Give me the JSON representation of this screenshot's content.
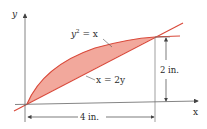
{
  "diagram": {
    "axes": {
      "x_label": "x",
      "y_label": "y"
    },
    "curves": [
      {
        "name": "parabola",
        "equation_base": "y",
        "equation_exp": "2",
        "equation_rest": " = x"
      },
      {
        "name": "line",
        "equation": "x = 2y"
      }
    ],
    "dimensions": {
      "width": "4 in.",
      "height": "2 in."
    },
    "colors": {
      "fill": "#f2a89c",
      "curve": "#d9493a",
      "axis": "#555555",
      "text": "#2a2a2a"
    }
  }
}
